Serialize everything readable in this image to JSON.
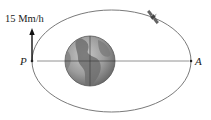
{
  "diagram": {
    "type": "orbit",
    "velocity_label": "15 Mm/h",
    "perigee_label": "P",
    "apogee_label": "A",
    "central_body": "earth",
    "orbiting_body": "satellite",
    "icons": {
      "earth": "earth-globe-icon",
      "satellite": "satellite-icon",
      "velocity_arrow": "arrow-up-icon"
    },
    "colors": {
      "orbit": "#7a7a7a",
      "axis_line": "#777777",
      "earth_fill": "#9a9a9a",
      "earth_land": "#6f6f6f",
      "text": "#222222",
      "arrow": "#111111"
    }
  }
}
